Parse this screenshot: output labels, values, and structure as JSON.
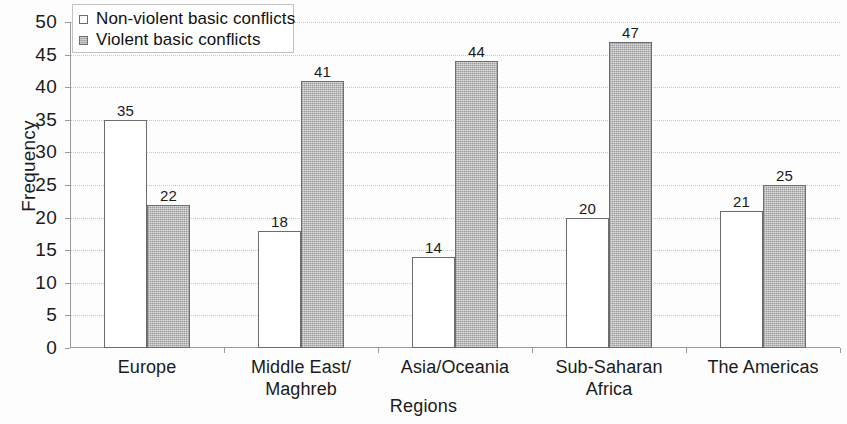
{
  "chart_data": {
    "type": "bar",
    "title": "",
    "xlabel": "Regions",
    "ylabel": "Frequency",
    "ylim": [
      0,
      50
    ],
    "ytick_step": 5,
    "yticks": [
      50,
      45,
      40,
      35,
      30,
      25,
      20,
      15,
      10,
      5,
      0
    ],
    "grid": true,
    "legend_position": "top-left",
    "categories": [
      "Europe",
      "Middle East/ Maghreb",
      "Asia/Oceania",
      "Sub-Saharan Africa",
      "The Americas"
    ],
    "category_lines": [
      [
        "Europe"
      ],
      [
        "Middle East/",
        "Maghreb"
      ],
      [
        "Asia/Oceania"
      ],
      [
        "Sub-Saharan",
        "Africa"
      ],
      [
        "The Americas"
      ]
    ],
    "series": [
      {
        "name": "Non-violent basic conflicts",
        "key": "nonviolent",
        "color": "#ffffff",
        "border_color": "#6d6d6d",
        "values": [
          35,
          18,
          14,
          20,
          21
        ]
      },
      {
        "name": "Violent basic conflicts",
        "key": "violent",
        "color": "#ababab",
        "border_color": "#6e6e6e",
        "values": [
          22,
          41,
          44,
          47,
          25
        ]
      }
    ]
  },
  "legend": {
    "items": [
      {
        "label": "Non-violent basic conflicts",
        "swatch": "nonviolent"
      },
      {
        "label": "Violent basic conflicts",
        "swatch": "violent"
      }
    ]
  },
  "axes": {
    "y_title": "Frequency",
    "x_title": "Regions"
  },
  "colors": {
    "axis": "#9a9a9a",
    "grid": "#c9c9c9",
    "text": "#1b1b1b",
    "violent_fill": "#ababab",
    "nonviolent_fill": "#ffffff"
  }
}
